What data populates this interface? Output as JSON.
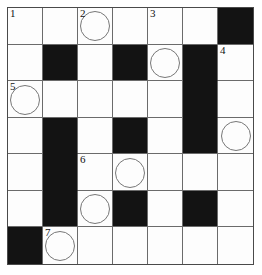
{
  "puzzle": {
    "type": "crossword-grid",
    "title": "",
    "rows": 7,
    "columns": 7,
    "colors": {
      "block": "#131313",
      "cell": "#fdfdfd",
      "grid_line": "#6b6b6b",
      "frame": "#4a4a4a",
      "number": "#111111",
      "circle_stroke": "#777777"
    },
    "legend": {
      "block_label": "blocked-square",
      "circle_label": "circled-square",
      "open_label": "open-square"
    },
    "clue_numbers": [
      {
        "number": "1",
        "row": 1,
        "col": 1
      },
      {
        "number": "2",
        "row": 1,
        "col": 3
      },
      {
        "number": "3",
        "row": 1,
        "col": 5
      },
      {
        "number": "4",
        "row": 2,
        "col": 7
      },
      {
        "number": "5",
        "row": 3,
        "col": 1
      },
      {
        "number": "6",
        "row": 5,
        "col": 3
      },
      {
        "number": "7",
        "row": 7,
        "col": 2
      }
    ],
    "circled_cells": [
      {
        "row": 1,
        "col": 3
      },
      {
        "row": 2,
        "col": 5
      },
      {
        "row": 3,
        "col": 1
      },
      {
        "row": 4,
        "col": 7
      },
      {
        "row": 5,
        "col": 4
      },
      {
        "row": 6,
        "col": 3
      },
      {
        "row": 7,
        "col": 2
      }
    ],
    "cells": [
      [
        {
          "block": false,
          "number": "1",
          "circle": false,
          "letter": ""
        },
        {
          "block": false,
          "number": "",
          "circle": false,
          "letter": ""
        },
        {
          "block": false,
          "number": "2",
          "circle": true,
          "letter": ""
        },
        {
          "block": false,
          "number": "",
          "circle": false,
          "letter": ""
        },
        {
          "block": false,
          "number": "3",
          "circle": false,
          "letter": ""
        },
        {
          "block": false,
          "number": "",
          "circle": false,
          "letter": ""
        },
        {
          "block": true,
          "number": "",
          "circle": false,
          "letter": ""
        }
      ],
      [
        {
          "block": false,
          "number": "",
          "circle": false,
          "letter": ""
        },
        {
          "block": true,
          "number": "",
          "circle": false,
          "letter": ""
        },
        {
          "block": false,
          "number": "",
          "circle": false,
          "letter": ""
        },
        {
          "block": true,
          "number": "",
          "circle": false,
          "letter": ""
        },
        {
          "block": false,
          "number": "",
          "circle": true,
          "letter": ""
        },
        {
          "block": true,
          "number": "",
          "circle": false,
          "letter": ""
        },
        {
          "block": false,
          "number": "4",
          "circle": false,
          "letter": ""
        }
      ],
      [
        {
          "block": false,
          "number": "5",
          "circle": true,
          "letter": ""
        },
        {
          "block": false,
          "number": "",
          "circle": false,
          "letter": ""
        },
        {
          "block": false,
          "number": "",
          "circle": false,
          "letter": ""
        },
        {
          "block": false,
          "number": "",
          "circle": false,
          "letter": ""
        },
        {
          "block": false,
          "number": "",
          "circle": false,
          "letter": ""
        },
        {
          "block": true,
          "number": "",
          "circle": false,
          "letter": ""
        },
        {
          "block": false,
          "number": "",
          "circle": false,
          "letter": ""
        }
      ],
      [
        {
          "block": false,
          "number": "",
          "circle": false,
          "letter": ""
        },
        {
          "block": true,
          "number": "",
          "circle": false,
          "letter": ""
        },
        {
          "block": false,
          "number": "",
          "circle": false,
          "letter": ""
        },
        {
          "block": true,
          "number": "",
          "circle": false,
          "letter": ""
        },
        {
          "block": false,
          "number": "",
          "circle": false,
          "letter": ""
        },
        {
          "block": true,
          "number": "",
          "circle": false,
          "letter": ""
        },
        {
          "block": false,
          "number": "",
          "circle": true,
          "letter": ""
        }
      ],
      [
        {
          "block": false,
          "number": "",
          "circle": false,
          "letter": ""
        },
        {
          "block": true,
          "number": "",
          "circle": false,
          "letter": ""
        },
        {
          "block": false,
          "number": "6",
          "circle": false,
          "letter": ""
        },
        {
          "block": false,
          "number": "",
          "circle": true,
          "letter": ""
        },
        {
          "block": false,
          "number": "",
          "circle": false,
          "letter": ""
        },
        {
          "block": false,
          "number": "",
          "circle": false,
          "letter": ""
        },
        {
          "block": false,
          "number": "",
          "circle": false,
          "letter": ""
        }
      ],
      [
        {
          "block": false,
          "number": "",
          "circle": false,
          "letter": ""
        },
        {
          "block": true,
          "number": "",
          "circle": false,
          "letter": ""
        },
        {
          "block": false,
          "number": "",
          "circle": true,
          "letter": ""
        },
        {
          "block": true,
          "number": "",
          "circle": false,
          "letter": ""
        },
        {
          "block": false,
          "number": "",
          "circle": false,
          "letter": ""
        },
        {
          "block": true,
          "number": "",
          "circle": false,
          "letter": ""
        },
        {
          "block": false,
          "number": "",
          "circle": false,
          "letter": ""
        }
      ],
      [
        {
          "block": true,
          "number": "",
          "circle": false,
          "letter": ""
        },
        {
          "block": false,
          "number": "7",
          "circle": true,
          "letter": ""
        },
        {
          "block": false,
          "number": "",
          "circle": false,
          "letter": ""
        },
        {
          "block": false,
          "number": "",
          "circle": false,
          "letter": ""
        },
        {
          "block": false,
          "number": "",
          "circle": false,
          "letter": ""
        },
        {
          "block": false,
          "number": "",
          "circle": false,
          "letter": ""
        },
        {
          "block": false,
          "number": "",
          "circle": false,
          "letter": ""
        }
      ]
    ]
  }
}
